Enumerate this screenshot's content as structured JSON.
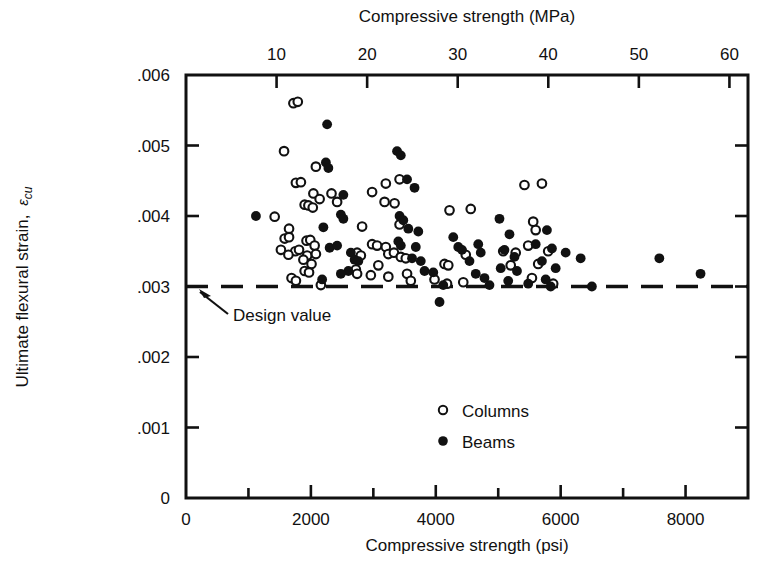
{
  "chart_data": {
    "type": "scatter",
    "title": "",
    "top_axis": {
      "label": "Compressive strength (MPa)",
      "ticks": [
        10,
        20,
        30,
        40,
        50,
        60
      ],
      "tick_labels": [
        "10",
        "20",
        "30",
        "40",
        "50",
        "60"
      ],
      "range": [
        0,
        62.05
      ]
    },
    "xlabel": "Compressive strength (psi)",
    "x_ticks_major": [
      0,
      2000,
      4000,
      6000,
      8000
    ],
    "x_tick_labels": [
      "0",
      "2000",
      "4000",
      "6000",
      "8000"
    ],
    "x_ticks_minor": [
      1000,
      3000,
      5000,
      7000,
      9000
    ],
    "xlim": [
      0,
      9000
    ],
    "ylabel_main": "Ultimate flexural strain,",
    "ylabel_symbol": "ε",
    "ylabel_subscript": "cu",
    "y_ticks": [
      0,
      0.001,
      0.002,
      0.003,
      0.004,
      0.005,
      0.006
    ],
    "y_tick_labels": [
      "0",
      ".001",
      ".002",
      ".003",
      ".004",
      ".005",
      ".006"
    ],
    "ylim": [
      0,
      0.006
    ],
    "grid": false,
    "reference_line": {
      "value": 0.003,
      "label": "Design value",
      "style": "dashed",
      "orientation": "horizontal"
    },
    "legend": {
      "position": "inside-lower-center",
      "entries": [
        {
          "name": "Columns",
          "marker": "open-circle"
        },
        {
          "name": "Beams",
          "marker": "filled-circle"
        }
      ]
    },
    "series": [
      {
        "name": "Columns",
        "marker": "open-circle",
        "points": [
          [
            1720,
            0.0056
          ],
          [
            1790,
            0.00562
          ],
          [
            1570,
            0.00492
          ],
          [
            2080,
            0.0047
          ],
          [
            1760,
            0.00447
          ],
          [
            1840,
            0.00448
          ],
          [
            2040,
            0.00432
          ],
          [
            2140,
            0.00424
          ],
          [
            1900,
            0.00416
          ],
          [
            1960,
            0.00415
          ],
          [
            2030,
            0.00412
          ],
          [
            1420,
            0.00399
          ],
          [
            2420,
            0.0042
          ],
          [
            2330,
            0.00432
          ],
          [
            1650,
            0.00382
          ],
          [
            1580,
            0.00368
          ],
          [
            1650,
            0.0037
          ],
          [
            1930,
            0.00365
          ],
          [
            1990,
            0.00366
          ],
          [
            2060,
            0.00358
          ],
          [
            1520,
            0.00352
          ],
          [
            1750,
            0.0035
          ],
          [
            1810,
            0.00352
          ],
          [
            1940,
            0.00344
          ],
          [
            2080,
            0.00346
          ],
          [
            1640,
            0.00345
          ],
          [
            1880,
            0.00338
          ],
          [
            2010,
            0.00332
          ],
          [
            1900,
            0.00322
          ],
          [
            1970,
            0.0032
          ],
          [
            1690,
            0.00312
          ],
          [
            1760,
            0.00308
          ],
          [
            2160,
            0.00302
          ],
          [
            3200,
            0.00446
          ],
          [
            3420,
            0.00452
          ],
          [
            2980,
            0.00434
          ],
          [
            3180,
            0.0042
          ],
          [
            3340,
            0.00418
          ],
          [
            2820,
            0.00385
          ],
          [
            3420,
            0.00388
          ],
          [
            2980,
            0.0036
          ],
          [
            3060,
            0.00358
          ],
          [
            3200,
            0.00356
          ],
          [
            2740,
            0.00348
          ],
          [
            2800,
            0.00344
          ],
          [
            3240,
            0.00346
          ],
          [
            3330,
            0.00348
          ],
          [
            3440,
            0.00342
          ],
          [
            3520,
            0.0034
          ],
          [
            3080,
            0.0033
          ],
          [
            2720,
            0.00324
          ],
          [
            2740,
            0.00318
          ],
          [
            2960,
            0.00316
          ],
          [
            3240,
            0.00314
          ],
          [
            3540,
            0.00318
          ],
          [
            3600,
            0.00308
          ],
          [
            4220,
            0.00408
          ],
          [
            4560,
            0.0041
          ],
          [
            4480,
            0.00345
          ],
          [
            4140,
            0.00332
          ],
          [
            4200,
            0.0033
          ],
          [
            3980,
            0.0031
          ],
          [
            4440,
            0.00306
          ],
          [
            4180,
            0.00304
          ],
          [
            5080,
            0.0035
          ],
          [
            5280,
            0.00348
          ],
          [
            5200,
            0.0033
          ],
          [
            5420,
            0.00444
          ],
          [
            5700,
            0.00446
          ],
          [
            5560,
            0.00392
          ],
          [
            5600,
            0.0038
          ],
          [
            5480,
            0.00358
          ],
          [
            5800,
            0.0035
          ],
          [
            5640,
            0.00332
          ],
          [
            5540,
            0.00312
          ],
          [
            5880,
            0.00304
          ]
        ]
      },
      {
        "name": "Beams",
        "marker": "filled-circle",
        "points": [
          [
            2260,
            0.0053
          ],
          [
            2240,
            0.00476
          ],
          [
            2280,
            0.00468
          ],
          [
            1120,
            0.004
          ],
          [
            2520,
            0.0043
          ],
          [
            2200,
            0.00384
          ],
          [
            2480,
            0.00402
          ],
          [
            2520,
            0.00396
          ],
          [
            2300,
            0.00355
          ],
          [
            2420,
            0.00358
          ],
          [
            2640,
            0.00348
          ],
          [
            2700,
            0.00338
          ],
          [
            2760,
            0.00336
          ],
          [
            2600,
            0.00322
          ],
          [
            2480,
            0.00318
          ],
          [
            2180,
            0.0031
          ],
          [
            3380,
            0.00492
          ],
          [
            3440,
            0.00486
          ],
          [
            3540,
            0.00452
          ],
          [
            3660,
            0.0044
          ],
          [
            3420,
            0.004
          ],
          [
            3480,
            0.00394
          ],
          [
            3560,
            0.00382
          ],
          [
            3720,
            0.00378
          ],
          [
            3400,
            0.00364
          ],
          [
            3440,
            0.00358
          ],
          [
            3680,
            0.00356
          ],
          [
            3620,
            0.0034
          ],
          [
            3760,
            0.00336
          ],
          [
            3820,
            0.00322
          ],
          [
            3960,
            0.0032
          ],
          [
            4060,
            0.00278
          ],
          [
            4120,
            0.00302
          ],
          [
            4280,
            0.0037
          ],
          [
            4360,
            0.00356
          ],
          [
            4420,
            0.00352
          ],
          [
            4680,
            0.0036
          ],
          [
            4720,
            0.00348
          ],
          [
            4540,
            0.00336
          ],
          [
            4640,
            0.00318
          ],
          [
            4780,
            0.00312
          ],
          [
            4860,
            0.00302
          ],
          [
            5020,
            0.00396
          ],
          [
            5180,
            0.00374
          ],
          [
            5100,
            0.00352
          ],
          [
            5260,
            0.00342
          ],
          [
            5040,
            0.00326
          ],
          [
            5300,
            0.00322
          ],
          [
            5160,
            0.00308
          ],
          [
            5480,
            0.00304
          ],
          [
            5600,
            0.0036
          ],
          [
            5780,
            0.0038
          ],
          [
            5860,
            0.00354
          ],
          [
            5700,
            0.00336
          ],
          [
            5920,
            0.00326
          ],
          [
            5760,
            0.0031
          ],
          [
            5840,
            0.003
          ],
          [
            6080,
            0.00348
          ],
          [
            6320,
            0.0034
          ],
          [
            6500,
            0.003
          ],
          [
            7580,
            0.0034
          ],
          [
            8240,
            0.00318
          ]
        ]
      }
    ]
  },
  "axes": {
    "bottom_title": "Compressive strength (psi)",
    "top_title": "Compressive strength (MPa)"
  },
  "annotations": {
    "design_value": "Design value"
  },
  "legend_items": {
    "columns": "Columns",
    "beams": "Beams"
  },
  "colors": {
    "ink": "#111111",
    "background": "#ffffff"
  }
}
